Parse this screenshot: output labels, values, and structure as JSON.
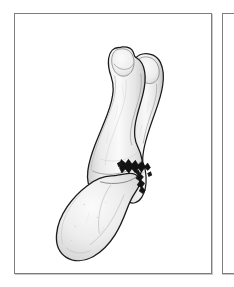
{
  "document": {
    "type": "anatomical-illustration",
    "subject": "fractured phalanx bones of a toe",
    "view": "oblique lateral view"
  },
  "panels": [
    {
      "id": "panel-primary",
      "name": "illustration-panel",
      "background": "#ffffff",
      "border_color": "#7d7d7d",
      "shadow_color": "#c9c9c9",
      "content": "bone-illustration"
    },
    {
      "id": "panel-secondary",
      "name": "adjacent-panel",
      "background": "#ffffff",
      "border_color": "#7d7d7d",
      "shadow_color": "#c9c9c9",
      "content": "empty"
    }
  ],
  "illustration": {
    "title": "",
    "caption": "",
    "style": "line-drawing-with-grayscale-shading",
    "outline_color": "#1a1a1a",
    "bone_fill_light": "#f7f7f7",
    "bone_fill_mid": "#e4e4e4",
    "bone_fill_shadow": "#c8c8c8",
    "fracture_color": "#111111",
    "parts": [
      {
        "name": "distal-phalanx",
        "label": "",
        "description": "upper long bone with rounded tuft at tip, angled from upper-left downward"
      },
      {
        "name": "middle-phalanx",
        "label": "",
        "description": "shorter bone to the right with rounded head, fractured at its base"
      },
      {
        "name": "proximal-phalanx-base",
        "label": "",
        "description": "large rounded bone mass at lower-left"
      },
      {
        "name": "fracture-line",
        "label": "",
        "description": "dark jagged transverse break across the right bone near its base"
      }
    ]
  }
}
